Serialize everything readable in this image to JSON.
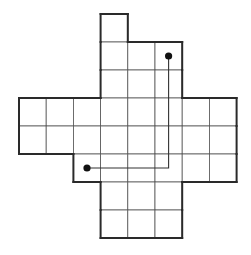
{
  "diagram": {
    "type": "grid-polyomino-path",
    "grid_columns": 8,
    "grid_rows": 9,
    "shape_rows": [
      {
        "row": 0,
        "cols": [
          3
        ]
      },
      {
        "row": 1,
        "cols": [
          3,
          4,
          5
        ]
      },
      {
        "row": 2,
        "cols": [
          3,
          4,
          5
        ]
      },
      {
        "row": 3,
        "cols": [
          0,
          1,
          2,
          3,
          4,
          5,
          6,
          7
        ]
      },
      {
        "row": 4,
        "cols": [
          0,
          1,
          2,
          3,
          4,
          5,
          6,
          7
        ]
      },
      {
        "row": 5,
        "cols": [
          2,
          3,
          4,
          5,
          6,
          7
        ]
      },
      {
        "row": 6,
        "cols": [
          3,
          4,
          5
        ]
      },
      {
        "row": 7,
        "cols": [
          3,
          4,
          5
        ]
      }
    ],
    "points": [
      {
        "name": "start",
        "row": 1,
        "col": 5
      },
      {
        "name": "end",
        "row": 5,
        "col": 2
      }
    ],
    "route": [
      {
        "row": 1,
        "col": 5
      },
      {
        "row": 5,
        "col": 5
      },
      {
        "row": 5,
        "col": 2
      }
    ],
    "colors": {
      "grid_line": "#555555",
      "outline": "#2a2a2a",
      "dot": "#111111",
      "background": "#ffffff"
    }
  }
}
